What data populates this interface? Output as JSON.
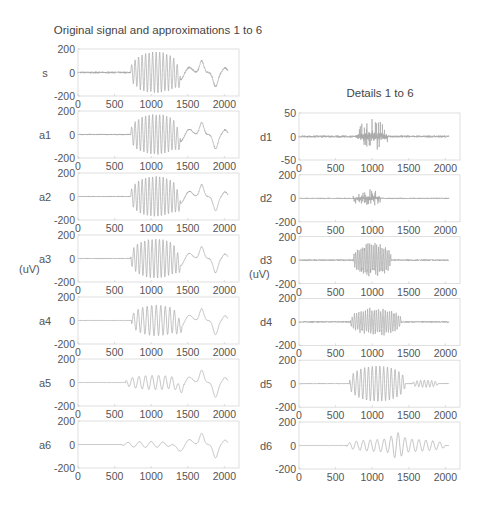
{
  "chart_data": [
    {
      "type": "line",
      "title": "Original signal and approximations 1 to 6",
      "ylabel": "(uV)",
      "xlabel": "",
      "xlim": [
        0,
        2200
      ],
      "x_ticks": [
        0,
        500,
        1000,
        1500,
        2000
      ],
      "grid": false,
      "panels": [
        {
          "name": "s",
          "ylim": [
            -200,
            200
          ],
          "y_ticks": [
            -200,
            0,
            200
          ],
          "description": "raw EEG-like signal: low noise 0-700, large oscillation burst ~720-1400 (amplitude ~170), slow wave bump ~1500, spike ~1700, dip ~1850, recovery ~2000",
          "x_end": 2048
        },
        {
          "name": "a1",
          "ylim": [
            -200,
            200
          ],
          "y_ticks": [
            -200,
            0,
            200
          ],
          "x_end": 2048,
          "description": "approximation level 1, nearly identical to s"
        },
        {
          "name": "a2",
          "ylim": [
            -200,
            200
          ],
          "y_ticks": [
            -200,
            0,
            200
          ],
          "x_end": 2048,
          "description": "approximation level 2, slightly smoother"
        },
        {
          "name": "a3",
          "ylim": [
            -200,
            200
          ],
          "y_ticks": [
            -200,
            0,
            200
          ],
          "x_end": 2048,
          "description": "approximation level 3, burst still visible, smoother"
        },
        {
          "name": "a4",
          "ylim": [
            -200,
            200
          ],
          "y_ticks": [
            -200,
            0,
            200
          ],
          "x_end": 2048,
          "description": "approximation level 4, burst ~750-1400 with lower frequency"
        },
        {
          "name": "a5",
          "ylim": [
            -200,
            200
          ],
          "y_ticks": [
            -200,
            0,
            200
          ],
          "x_end": 2048,
          "description": "approximation level 5, mostly low frequency, dip ~1400, peak ~1700, dip ~1880"
        },
        {
          "name": "a6",
          "ylim": [
            -200,
            200
          ],
          "y_ticks": [
            -200,
            0,
            200
          ],
          "x_end": 2048,
          "description": "approximation level 6, slow wave: flat to ~1300, dip ~1400, peak ~1700, dip ~1880, back to ~0 at 2000"
        }
      ]
    },
    {
      "type": "line",
      "title": "Details 1 to 6",
      "ylabel": "(uV)",
      "xlabel": "",
      "xlim": [
        0,
        2200
      ],
      "x_ticks": [
        0,
        500,
        1000,
        1500,
        2000
      ],
      "grid": false,
      "panels": [
        {
          "name": "d1",
          "ylim": [
            -50,
            50
          ],
          "y_ticks": [
            -50,
            0,
            50
          ],
          "x_end": 2048,
          "description": "finest detail: low-level noise throughout, spikes ~800-1200 up to ~40"
        },
        {
          "name": "d2",
          "ylim": [
            -200,
            200
          ],
          "y_ticks": [
            -200,
            0,
            200
          ],
          "x_end": 2048,
          "description": "detail level 2: small noise, bursts ~750-1100 up to ~80"
        },
        {
          "name": "d3",
          "ylim": [
            -200,
            200
          ],
          "y_ticks": [
            -200,
            0,
            200
          ],
          "x_end": 2048,
          "description": "detail level 3: burst ~750-1250 up to ~150"
        },
        {
          "name": "d4",
          "ylim": [
            -200,
            200
          ],
          "y_ticks": [
            -200,
            0,
            200
          ],
          "x_end": 2048,
          "description": "detail level 4: burst ~700-1400 up to ~130"
        },
        {
          "name": "d5",
          "ylim": [
            -200,
            200
          ],
          "y_ticks": [
            -200,
            0,
            200
          ],
          "x_end": 2048,
          "description": "detail level 5: regular oscillation ~700-1450 amplitude ~150, smaller ripples ~1600-1900"
        },
        {
          "name": "d6",
          "ylim": [
            -200,
            200
          ],
          "y_ticks": [
            -200,
            0,
            200
          ],
          "x_end": 2048,
          "description": "detail level 6: slow oscillation ~650-2000, largest ~1300-1400 amplitude ~100"
        }
      ]
    }
  ]
}
